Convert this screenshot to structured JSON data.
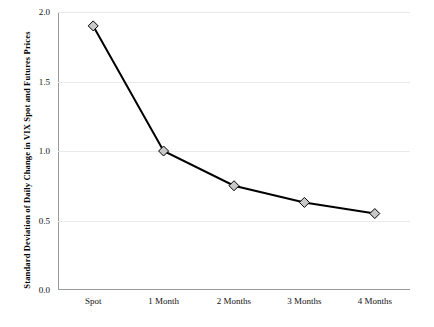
{
  "chart_data": {
    "type": "line",
    "title": "",
    "xlabel": "",
    "ylabel": "Standard Deviation of Daily Change in VIX Spot and Futures  Prices",
    "categories": [
      "Spot",
      "1 Month",
      "2 Months",
      "3 Months",
      "4 Months"
    ],
    "values": [
      1.9,
      1.0,
      0.75,
      0.63,
      0.55
    ],
    "ylim": [
      0.0,
      2.0
    ],
    "yticks": [
      0.0,
      0.5,
      1.0,
      1.5,
      2.0
    ],
    "ytick_labels": [
      "0.0",
      "0.5",
      "1.0",
      "1.5",
      "2.0"
    ],
    "grid": true,
    "legend": "none",
    "series": [
      {
        "name": "VIX spot and futures",
        "values": [
          1.9,
          1.0,
          0.75,
          0.63,
          0.55
        ],
        "line_color": "#000000",
        "marker": "diamond",
        "marker_fill": "#c8c8c8",
        "marker_edge": "#000000"
      }
    ]
  },
  "colors": {
    "axis": "#9a9a9a",
    "grid": "#e9e9e9",
    "text": "#111111",
    "background": "#ffffff"
  }
}
